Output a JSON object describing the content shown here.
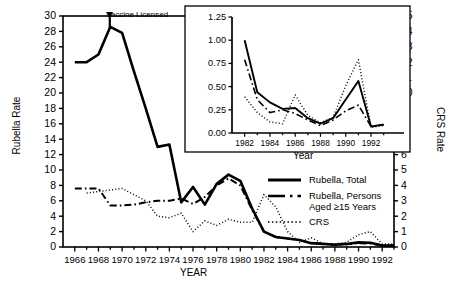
{
  "figure": {
    "left_axis_title": "Rubella Rate",
    "right_axis_title": "CRS Rate",
    "x_axis_title": "YEAR",
    "annotation": "Vaccine Licensed"
  },
  "inset": {
    "y_axis_title": "Rate",
    "x_axis_title": "Year"
  },
  "legend": {
    "items": [
      {
        "label": "Rubella, Total",
        "style": "solid",
        "name": "legend-rubella-total"
      },
      {
        "label": "Rubella, Persons\nAged ≥15 Years",
        "style": "dashdot",
        "name": "legend-rubella-15plus"
      },
      {
        "label": "CRS",
        "style": "dotted",
        "name": "legend-crs"
      }
    ]
  },
  "chart_data": {
    "type": "line",
    "title": "",
    "xlabel": "YEAR",
    "ylabel": "Rubella Rate",
    "y2label": "CRS Rate",
    "xlim": [
      1965,
      1993
    ],
    "ylim": [
      0,
      30
    ],
    "y2lim": [
      0,
      15
    ],
    "grid": false,
    "legend_position": "center-right",
    "annotations": [
      {
        "text": "Vaccine Licensed",
        "x": 1969,
        "y": 30,
        "arrow": true
      }
    ],
    "xticks": [
      1966,
      1968,
      1970,
      1972,
      1974,
      1976,
      1978,
      1980,
      1982,
      1984,
      1986,
      1988,
      1990,
      1992
    ],
    "yticks": [
      0,
      2,
      4,
      6,
      8,
      10,
      12,
      14,
      16,
      18,
      20,
      22,
      24,
      26,
      28,
      30
    ],
    "y2ticks": [
      0,
      1,
      2,
      3,
      4,
      5,
      6,
      7,
      8,
      9,
      10,
      11,
      12,
      13,
      14,
      15
    ],
    "x": [
      1966,
      1967,
      1968,
      1969,
      1970,
      1971,
      1972,
      1973,
      1974,
      1975,
      1976,
      1977,
      1978,
      1979,
      1980,
      1981,
      1982,
      1983,
      1984,
      1985,
      1986,
      1987,
      1988,
      1989,
      1990,
      1991,
      1992,
      1993
    ],
    "series": [
      {
        "name": "Rubella, Total",
        "axis": "left",
        "style": "solid",
        "values": [
          24.0,
          24.0,
          25.0,
          28.6,
          27.8,
          22.8,
          18.0,
          13.0,
          13.3,
          5.8,
          7.8,
          5.5,
          8.2,
          9.4,
          8.6,
          5.0,
          2.0,
          1.3,
          1.1,
          0.9,
          0.5,
          0.4,
          0.3,
          0.4,
          0.6,
          0.55,
          0.2,
          0.2
        ]
      },
      {
        "name": "Rubella, Persons Aged >=15 Years",
        "axis": "left",
        "style": "dashdot",
        "values": [
          7.6,
          7.6,
          7.6,
          5.4,
          5.4,
          5.5,
          5.8,
          6.0,
          6.0,
          6.3,
          5.6,
          6.5,
          8.0,
          8.9,
          8.0,
          4.8,
          2.0,
          1.3,
          1.1,
          0.9,
          0.5,
          0.4,
          0.3,
          0.35,
          0.5,
          0.45,
          0.2,
          0.2
        ]
      },
      {
        "name": "CRS",
        "axis": "right",
        "style": "dotted",
        "values": [
          null,
          3.5,
          3.6,
          3.7,
          3.8,
          3.4,
          3.0,
          2.0,
          1.9,
          2.2,
          1.0,
          1.7,
          1.4,
          1.8,
          1.6,
          1.6,
          3.4,
          2.6,
          1.0,
          0.3,
          0.6,
          0.2,
          0.2,
          0.3,
          0.8,
          1.0,
          0.2,
          0.2
        ]
      }
    ]
  },
  "inset_chart_data": {
    "type": "line",
    "title": "",
    "xlabel": "Year",
    "ylabel": "Rate",
    "xlim": [
      1981,
      1993.5
    ],
    "ylim": [
      0,
      1.25
    ],
    "grid": false,
    "xticks": [
      1982,
      1984,
      1986,
      1988,
      1990,
      1992
    ],
    "yticks": [
      0.0,
      0.25,
      0.5,
      0.75,
      1.0,
      1.25
    ],
    "ytick_labels": [
      "0.00",
      "0.25",
      "0.50",
      "0.75",
      "1.00",
      "1.25"
    ],
    "x": [
      1982,
      1983,
      1984,
      1985,
      1986,
      1987,
      1988,
      1989,
      1990,
      1991,
      1992,
      1993
    ],
    "series": [
      {
        "name": "Rubella, Total",
        "style": "solid",
        "values": [
          1.0,
          0.44,
          0.33,
          0.26,
          0.27,
          0.16,
          0.1,
          0.16,
          0.36,
          0.56,
          0.07,
          0.09
        ]
      },
      {
        "name": "Rubella, Persons Aged >=15 Years",
        "style": "dashdot",
        "values": [
          0.79,
          0.36,
          0.22,
          0.25,
          0.21,
          0.14,
          0.08,
          0.14,
          0.24,
          0.3,
          0.07,
          0.09
        ]
      },
      {
        "name": "CRS",
        "style": "dotted",
        "values": [
          0.39,
          0.22,
          0.12,
          0.1,
          0.41,
          0.19,
          0.11,
          0.17,
          0.51,
          0.79,
          0.06,
          0.08
        ]
      }
    ]
  }
}
